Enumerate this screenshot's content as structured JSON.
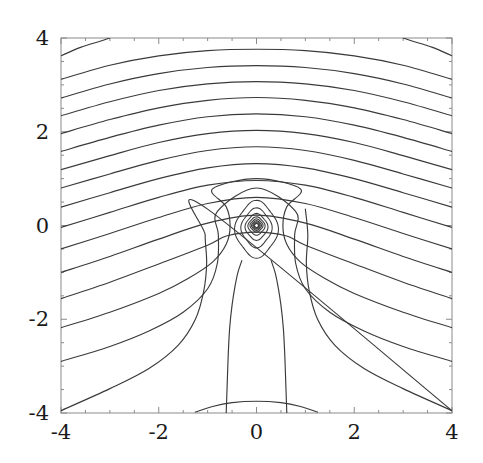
{
  "figure": {
    "title": "",
    "background_color": "#ffffff",
    "frame_color": "#8a8a8a",
    "contour_color": "#3a3a3a",
    "tick_color": "#8a8a8a",
    "label_color": "#1a1a1a"
  },
  "axes": {
    "x_label": "",
    "y_label": "",
    "x_ticks": [
      "-4",
      "-2",
      "0",
      "2",
      "4"
    ],
    "y_ticks": [
      "4",
      "2",
      "0",
      "-2",
      "-4"
    ],
    "x_tick_values": [
      -4,
      -2,
      0,
      2,
      4
    ],
    "y_tick_values": [
      4,
      2,
      0,
      -2,
      -4
    ],
    "x_minor_step": 0.5,
    "y_minor_step": 0.5,
    "xlim": [
      -4,
      4
    ],
    "ylim": [
      -4,
      4
    ],
    "frame": true,
    "grid": false,
    "tick_direction": "in"
  },
  "chart_data": {
    "type": "line",
    "plot_kind": "contour",
    "title": "",
    "xlabel": "",
    "ylabel": "",
    "xlim": [
      -4,
      4
    ],
    "ylim": [
      -4,
      4
    ],
    "grid": false,
    "legend": "none",
    "singularity": {
      "x": 0,
      "y": 0
    },
    "symmetry": "mirror about x = 0",
    "contour_count_visible": 28,
    "series": [
      {
        "name": "open-arc-1",
        "kind": "open",
        "points": [
          [
            -4,
            3.62
          ],
          [
            -3.6,
            3.8
          ],
          [
            -3.2,
            3.93
          ],
          [
            -3.0,
            4.0
          ]
        ]
      },
      {
        "name": "open-arc-1r",
        "kind": "open",
        "points": [
          [
            3.0,
            4.0
          ],
          [
            3.2,
            3.93
          ],
          [
            3.6,
            3.8
          ],
          [
            4,
            3.62
          ]
        ]
      },
      {
        "name": "open-arc-2",
        "kind": "open",
        "points": [
          [
            -4,
            3.12
          ],
          [
            -3,
            3.42
          ],
          [
            -2,
            3.62
          ],
          [
            -1,
            3.73
          ],
          [
            0,
            3.76
          ],
          [
            1,
            3.73
          ],
          [
            2,
            3.62
          ],
          [
            3,
            3.42
          ],
          [
            4,
            3.12
          ]
        ]
      },
      {
        "name": "open-arc-3",
        "kind": "open",
        "points": [
          [
            -4,
            2.72
          ],
          [
            -3,
            3.02
          ],
          [
            -2,
            3.24
          ],
          [
            -1,
            3.37
          ],
          [
            0,
            3.41
          ],
          [
            1,
            3.37
          ],
          [
            2,
            3.24
          ],
          [
            3,
            3.02
          ],
          [
            4,
            2.72
          ]
        ]
      },
      {
        "name": "open-arc-4",
        "kind": "open",
        "points": [
          [
            -4,
            2.34
          ],
          [
            -3,
            2.64
          ],
          [
            -2,
            2.88
          ],
          [
            -1,
            3.02
          ],
          [
            0,
            3.07
          ],
          [
            1,
            3.02
          ],
          [
            2,
            2.88
          ],
          [
            3,
            2.64
          ],
          [
            4,
            2.34
          ]
        ]
      },
      {
        "name": "open-arc-5",
        "kind": "open",
        "points": [
          [
            -4,
            1.96
          ],
          [
            -3,
            2.26
          ],
          [
            -2,
            2.51
          ],
          [
            -1,
            2.67
          ],
          [
            0,
            2.73
          ],
          [
            1,
            2.67
          ],
          [
            2,
            2.51
          ],
          [
            3,
            2.26
          ],
          [
            4,
            1.96
          ]
        ]
      },
      {
        "name": "open-arc-6",
        "kind": "open",
        "points": [
          [
            -4,
            1.58
          ],
          [
            -3,
            1.88
          ],
          [
            -2,
            2.14
          ],
          [
            -1,
            2.32
          ],
          [
            0,
            2.38
          ],
          [
            1,
            2.32
          ],
          [
            2,
            2.14
          ],
          [
            3,
            1.88
          ],
          [
            4,
            1.58
          ]
        ]
      },
      {
        "name": "open-arc-7",
        "kind": "open",
        "points": [
          [
            -4,
            1.19
          ],
          [
            -3,
            1.49
          ],
          [
            -2,
            1.77
          ],
          [
            -1,
            1.96
          ],
          [
            0,
            2.03
          ],
          [
            1,
            1.96
          ],
          [
            2,
            1.77
          ],
          [
            3,
            1.49
          ],
          [
            4,
            1.19
          ]
        ]
      },
      {
        "name": "open-arc-8",
        "kind": "open",
        "points": [
          [
            -4,
            0.8
          ],
          [
            -3,
            1.1
          ],
          [
            -2,
            1.39
          ],
          [
            -1,
            1.6
          ],
          [
            0,
            1.68
          ],
          [
            1,
            1.6
          ],
          [
            2,
            1.39
          ],
          [
            3,
            1.1
          ],
          [
            4,
            0.8
          ]
        ]
      },
      {
        "name": "open-arc-9",
        "kind": "open",
        "points": [
          [
            -4,
            0.39
          ],
          [
            -3,
            0.7
          ],
          [
            -2,
            1.0
          ],
          [
            -1,
            1.23
          ],
          [
            0,
            1.32
          ],
          [
            1,
            1.23
          ],
          [
            2,
            1.0
          ],
          [
            3,
            0.7
          ],
          [
            4,
            0.39
          ]
        ]
      },
      {
        "name": "open-arc-10",
        "kind": "open",
        "points": [
          [
            -4,
            -0.04
          ],
          [
            -3,
            0.28
          ],
          [
            -2,
            0.6
          ],
          [
            -1,
            0.86
          ],
          [
            0,
            0.96
          ],
          [
            1,
            0.86
          ],
          [
            2,
            0.6
          ],
          [
            3,
            0.28
          ],
          [
            4,
            -0.04
          ]
        ]
      },
      {
        "name": "open-arc-11",
        "kind": "open",
        "points": [
          [
            -4,
            -0.5
          ],
          [
            -3,
            -0.17
          ],
          [
            -2,
            0.17
          ],
          [
            -1,
            0.47
          ],
          [
            0,
            0.6
          ],
          [
            1,
            0.47
          ],
          [
            2,
            0.17
          ],
          [
            3,
            -0.17
          ],
          [
            4,
            -0.5
          ]
        ]
      },
      {
        "name": "open-arc-12",
        "kind": "open",
        "points": [
          [
            -4,
            -1.0
          ],
          [
            -3,
            -0.66
          ],
          [
            -2,
            -0.29
          ],
          [
            -1,
            0.05
          ],
          [
            0,
            0.22
          ],
          [
            1,
            0.05
          ],
          [
            2,
            -0.29
          ],
          [
            3,
            -0.66
          ],
          [
            4,
            -1.0
          ]
        ]
      },
      {
        "name": "open-arc-13",
        "kind": "open",
        "points": [
          [
            -4,
            -1.56
          ],
          [
            -3,
            -1.21
          ],
          [
            -2,
            -0.82
          ],
          [
            -1,
            -0.42
          ],
          [
            -0.6,
            -0.22
          ],
          [
            0,
            -0.14
          ],
          [
            0.6,
            -0.22
          ],
          [
            1,
            -0.42
          ],
          [
            2,
            -0.82
          ],
          [
            3,
            -1.21
          ],
          [
            4,
            -1.56
          ]
        ]
      },
      {
        "name": "open-arc-14",
        "kind": "open",
        "points": [
          [
            -4,
            -2.18
          ],
          [
            -3,
            -1.85
          ],
          [
            -2,
            -1.45
          ],
          [
            -1.4,
            -1.13
          ],
          [
            -0.9,
            -0.78
          ],
          [
            -0.62,
            -0.4
          ],
          [
            -0.54,
            0.0
          ],
          [
            -0.62,
            0.4
          ],
          [
            -0.9,
            0.78
          ],
          [
            0,
            1.0
          ],
          [
            0.9,
            0.78
          ],
          [
            0.62,
            0.4
          ],
          [
            0.54,
            0.0
          ],
          [
            0.62,
            -0.4
          ],
          [
            0.9,
            -0.78
          ],
          [
            1.4,
            -1.13
          ],
          [
            2,
            -1.45
          ],
          [
            3,
            -1.85
          ],
          [
            4,
            -2.18
          ]
        ]
      },
      {
        "name": "open-arc-15",
        "kind": "open",
        "points": [
          [
            -4,
            -2.9
          ],
          [
            -3,
            -2.58
          ],
          [
            -2.2,
            -2.25
          ],
          [
            -1.5,
            -1.85
          ],
          [
            -1.0,
            -1.35
          ],
          [
            -0.8,
            -0.8
          ],
          [
            -0.78,
            -0.2
          ],
          [
            -0.8,
            0.3
          ],
          [
            0,
            0.8
          ],
          [
            0.8,
            0.3
          ],
          [
            0.78,
            -0.2
          ],
          [
            0.8,
            -0.8
          ],
          [
            1.0,
            -1.35
          ],
          [
            1.5,
            -1.85
          ],
          [
            2.2,
            -2.25
          ],
          [
            3,
            -2.58
          ],
          [
            4,
            -2.9
          ]
        ]
      },
      {
        "name": "open-arc-16",
        "kind": "open",
        "points": [
          [
            -4,
            -3.95
          ],
          [
            -3,
            -3.48
          ],
          [
            -2.2,
            -3.05
          ],
          [
            -1.6,
            -2.55
          ],
          [
            -1.25,
            -2.0
          ],
          [
            -1.08,
            -1.4
          ],
          [
            -1.02,
            -0.8
          ],
          [
            -1.05,
            -0.2
          ],
          [
            -1.0,
            0.35
          ],
          [
            4,
            -3.95
          ]
        ]
      },
      {
        "name": "stem-left",
        "kind": "open",
        "points": [
          [
            -0.62,
            -4.0
          ],
          [
            -0.6,
            -3.4
          ],
          [
            -0.58,
            -2.8
          ],
          [
            -0.55,
            -2.2
          ],
          [
            -0.5,
            -1.7
          ],
          [
            -0.44,
            -1.3
          ],
          [
            -0.38,
            -1.0
          ],
          [
            -0.3,
            -0.75
          ]
        ]
      },
      {
        "name": "stem-right",
        "kind": "open",
        "points": [
          [
            0.62,
            -4.0
          ],
          [
            0.6,
            -3.4
          ],
          [
            0.58,
            -2.8
          ],
          [
            0.55,
            -2.2
          ],
          [
            0.5,
            -1.7
          ],
          [
            0.44,
            -1.3
          ],
          [
            0.38,
            -1.0
          ],
          [
            0.3,
            -0.75
          ]
        ]
      },
      {
        "name": "closed-loop-1",
        "kind": "closed",
        "center": [
          0,
          0
        ],
        "radius_x": 0.42,
        "radius_y": 0.58,
        "center_offset_y": -0.08
      },
      {
        "name": "closed-loop-2",
        "kind": "closed",
        "center": [
          0,
          0
        ],
        "radius_x": 0.3,
        "radius_y": 0.4,
        "center_offset_y": -0.05
      },
      {
        "name": "closed-loop-3",
        "kind": "closed",
        "center": [
          0,
          0
        ],
        "radius_x": 0.22,
        "radius_y": 0.27,
        "center_offset_y": -0.03
      },
      {
        "name": "closed-loop-4",
        "kind": "closed",
        "center": [
          0,
          0
        ],
        "radius_x": 0.165,
        "radius_y": 0.185,
        "center_offset_y": -0.01
      },
      {
        "name": "closed-loop-5",
        "kind": "closed",
        "center": [
          0,
          0
        ],
        "radius_x": 0.125,
        "radius_y": 0.132,
        "center_offset_y": 0
      },
      {
        "name": "closed-loop-6",
        "kind": "closed",
        "center": [
          0,
          0
        ],
        "radius_x": 0.095,
        "radius_y": 0.098,
        "center_offset_y": 0
      },
      {
        "name": "closed-loop-7",
        "kind": "closed",
        "center": [
          0,
          0
        ],
        "radius_x": 0.072,
        "radius_y": 0.074,
        "center_offset_y": 0
      },
      {
        "name": "closed-loop-8",
        "kind": "closed",
        "center": [
          0,
          0
        ],
        "radius_x": 0.054,
        "radius_y": 0.055,
        "center_offset_y": 0
      },
      {
        "name": "closed-loop-9",
        "kind": "closed",
        "center": [
          0,
          0
        ],
        "radius_x": 0.04,
        "radius_y": 0.041,
        "center_offset_y": 0
      },
      {
        "name": "bottom-arc",
        "kind": "open",
        "points": [
          [
            -1.25,
            -3.98
          ],
          [
            -0.9,
            -3.86
          ],
          [
            -0.5,
            -3.78
          ],
          [
            0,
            -3.75
          ],
          [
            0.5,
            -3.78
          ],
          [
            0.9,
            -3.86
          ],
          [
            1.25,
            -3.98
          ]
        ]
      }
    ]
  }
}
